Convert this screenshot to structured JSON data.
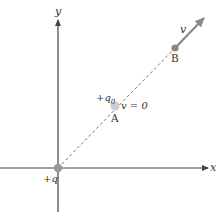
{
  "axes": {
    "x_label": "x",
    "y_label": "y",
    "color": "#444444"
  },
  "charges": {
    "source": {
      "label": "+q",
      "color": "#999999"
    },
    "test": {
      "label": "+q",
      "subscript": "0"
    }
  },
  "points": {
    "A": {
      "label": "A",
      "velocity_label": "v = 0",
      "color": "#cccccc"
    },
    "B": {
      "label": "B",
      "velocity_label": "v",
      "color": "#888888"
    }
  },
  "path": {
    "style": "dashed",
    "color": "#666666"
  },
  "velocity_arrow": {
    "color": "#888888"
  }
}
